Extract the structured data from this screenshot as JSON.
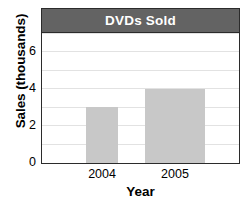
{
  "chart_data": {
    "type": "bar",
    "title": "DVDs Sold",
    "xlabel": "Year",
    "ylabel": "Sales (thousands)",
    "categories": [
      "2004",
      "2005"
    ],
    "values": [
      3,
      4
    ],
    "ylim": [
      0,
      7
    ],
    "ytick_labels": [
      "0",
      "2",
      "4",
      "6"
    ],
    "ytick_values": [
      0,
      2,
      4,
      6
    ],
    "gridlines": [
      1,
      2,
      3,
      4,
      5,
      6,
      7
    ],
    "grid": true,
    "legend": "none",
    "colors": {
      "bar_fill": "#c8c8c8",
      "title_bar_background": "#636363",
      "title_text": "#ffffff",
      "frame_border": "#2b2b2b",
      "gridline": "#e2e2e2",
      "plot_background": "#ffffff",
      "axis_text": "#000000"
    }
  }
}
